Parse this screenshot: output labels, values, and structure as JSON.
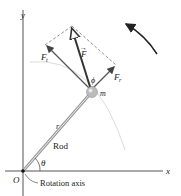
{
  "diagram": {
    "axes": {
      "x_label": "x",
      "y_label": "y",
      "origin_label": "O"
    },
    "labels": {
      "force": "F",
      "force_tangential": "F",
      "force_tangential_sub": "t",
      "force_radial": "F",
      "force_radial_sub": "r",
      "phi": "ϕ",
      "mass": "m",
      "radius": "r",
      "rod": "Rod",
      "theta": "θ",
      "rotation_axis": "Rotation axis"
    },
    "colors": {
      "axis": "#555555",
      "force": "#333333",
      "component": "#555555",
      "arc": "#d8d8d8",
      "rod": "#999999"
    }
  }
}
